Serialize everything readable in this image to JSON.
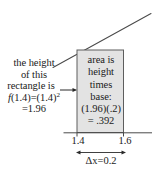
{
  "figure": {
    "curve": {
      "description": "increasing curve through top-left of rectangle",
      "color": "#4a4a4a"
    },
    "rectangle": {
      "fill_color": "#e3e3e3",
      "stroke_color": "#5a5a5a",
      "left_value": "1.4",
      "right_value": "1.6"
    },
    "axis": {
      "color": "#4a4a4a",
      "tick_labels": [
        "1.4",
        "1.6"
      ]
    },
    "left_annotation": {
      "lines": [
        "the height",
        "of this",
        "rectangle is"
      ],
      "formula_line_1_prefix": "f",
      "formula_line_1_body": "(1.4)=(1.4)",
      "formula_line_1_exponent": "2",
      "formula_line_2": "=1.96"
    },
    "rect_annotation": {
      "lines": [
        "area is",
        "height",
        "times",
        "base:",
        "(1.96)(.2)",
        "= .392"
      ]
    },
    "delta_annotation": {
      "symbol": "Δ",
      "text": "Δx=0.2"
    }
  }
}
